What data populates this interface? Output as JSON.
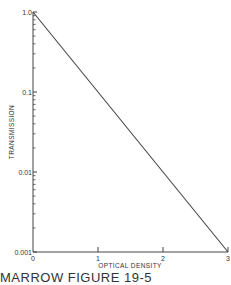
{
  "chart_data": {
    "type": "line",
    "title": "",
    "xlabel": "OPTICAL DENSITY",
    "ylabel": "TRANSMISSION",
    "xscale": "linear",
    "yscale": "log",
    "xlim": [
      0,
      3
    ],
    "ylim": [
      0.001,
      1.0
    ],
    "x_ticks": [
      0,
      1,
      2,
      3
    ],
    "x_tick_labels": [
      "0",
      "1",
      "2",
      "3"
    ],
    "y_ticks": [
      1.0,
      0.1,
      0.01,
      0.001
    ],
    "y_tick_labels": [
      "1.0",
      "0.1",
      "0.01",
      "0.001"
    ],
    "grid": false,
    "series": [
      {
        "name": "transmission",
        "x": [
          0,
          3
        ],
        "y": [
          1.0,
          0.001
        ]
      }
    ]
  },
  "caption": "MARROW FIGURE 19-5"
}
